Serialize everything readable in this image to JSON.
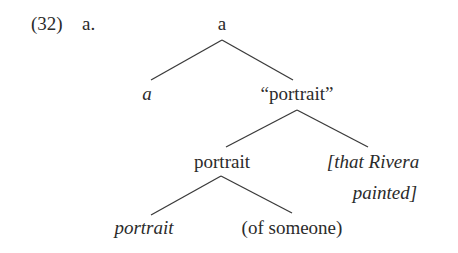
{
  "example": {
    "number": "(32)",
    "sub_label": "a."
  },
  "tree": {
    "root": {
      "label": "a"
    },
    "root_left": {
      "label": "a",
      "italic": true
    },
    "root_right": {
      "label": "“portrait”"
    },
    "mid": {
      "label": "portrait"
    },
    "mid_right_line1": {
      "label": "[that Rivera"
    },
    "mid_right_line2": {
      "label": "painted]"
    },
    "leaf_left": {
      "label": "portrait",
      "italic": true
    },
    "leaf_right": {
      "label": "(of someone)"
    }
  },
  "colors": {
    "text": "#2b2b2b",
    "lines": "#3a3a3a",
    "background": "#ffffff"
  }
}
